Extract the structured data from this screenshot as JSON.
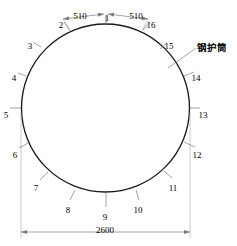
{
  "drawing": {
    "title": "钢护筒 截面分段图",
    "shape": "circle",
    "colors": {
      "outline": "#1b1b1b",
      "dimension": "#7a7a7a",
      "label_text": "#4a4a4a",
      "annotation_text": "#222222",
      "background": "#ffffff"
    },
    "geometry": {
      "center_x": 105.5,
      "center_y": 108,
      "radius": 84
    }
  },
  "annotation": {
    "text": "钢护筒",
    "leader_from_x": 196,
    "leader_from_y": 48,
    "leader_to_x": 168,
    "leader_to_y": 68
  },
  "dimensions": [
    {
      "id": "dim-chord-left",
      "value": "510",
      "text_x": 80,
      "text_y": 11,
      "line_x1": 63,
      "line_y1": 19,
      "line_x2": 104,
      "line_y2": 14
    },
    {
      "id": "dim-chord-right",
      "value": "510",
      "text_x": 136,
      "text_y": 11,
      "line_x1": 108,
      "line_y1": 14,
      "line_x2": 148,
      "line_y2": 19
    },
    {
      "id": "dim-diameter",
      "value": "2600",
      "text_x": 105,
      "text_y": 225,
      "line_x1": 21,
      "line_y1": 232,
      "line_x2": 190,
      "line_y2": 232
    }
  ],
  "segment_labels": [
    {
      "id": 1,
      "text": "1",
      "x": 106,
      "y": 13,
      "lx1": 106,
      "ly1": 16,
      "lx2": 106,
      "ly2": 24
    },
    {
      "id": 2,
      "text": "2",
      "x": 60,
      "y": 20,
      "lx1": 64,
      "ly1": 22,
      "lx2": 70,
      "ly2": 30
    },
    {
      "id": 3,
      "text": "3",
      "x": 29,
      "y": 41,
      "lx1": 33,
      "ly1": 42,
      "lx2": 41,
      "ly2": 47
    },
    {
      "id": 4,
      "text": "4",
      "x": 13,
      "y": 73,
      "lx1": 18,
      "ly1": 73,
      "lx2": 26,
      "ly2": 76
    },
    {
      "id": 5,
      "text": "5",
      "x": 5,
      "y": 110,
      "lx1": 10,
      "ly1": 108,
      "lx2": 21,
      "ly2": 108
    },
    {
      "id": 6,
      "text": "6",
      "x": 14,
      "y": 150,
      "lx1": 19,
      "ly1": 148,
      "lx2": 28,
      "ly2": 143
    },
    {
      "id": 7,
      "text": "7",
      "x": 35,
      "y": 183,
      "lx1": 40,
      "ly1": 180,
      "lx2": 48,
      "ly2": 172
    },
    {
      "id": 8,
      "text": "8",
      "x": 67,
      "y": 205,
      "lx1": 70,
      "ly1": 200,
      "lx2": 75,
      "ly2": 190
    },
    {
      "id": 9,
      "text": "9",
      "x": 104,
      "y": 212,
      "lx1": 106,
      "ly1": 207,
      "lx2": 106,
      "ly2": 192
    },
    {
      "id": 10,
      "text": "10",
      "x": 137,
      "y": 205,
      "lx1": 139,
      "ly1": 200,
      "lx2": 136,
      "ly2": 190
    },
    {
      "id": 11,
      "text": "11",
      "x": 172,
      "y": 183,
      "lx1": 172,
      "ly1": 178,
      "lx2": 164,
      "ly2": 171
    },
    {
      "id": 12,
      "text": "12",
      "x": 196,
      "y": 150,
      "lx1": 195,
      "ly1": 147,
      "lx2": 184,
      "ly2": 142
    },
    {
      "id": 13,
      "text": "13",
      "x": 202,
      "y": 110,
      "lx1": 200,
      "ly1": 108,
      "lx2": 190,
      "ly2": 108
    },
    {
      "id": 14,
      "text": "14",
      "x": 195,
      "y": 73,
      "lx1": 194,
      "ly1": 72,
      "lx2": 184,
      "ly2": 76
    },
    {
      "id": 15,
      "text": "15",
      "x": 168,
      "y": 41,
      "lx1": 167,
      "ly1": 43,
      "lx2": 160,
      "ly2": 49
    },
    {
      "id": 16,
      "text": "16",
      "x": 150,
      "y": 20,
      "lx1": 150,
      "ly1": 22,
      "lx2": 143,
      "ly2": 30
    }
  ]
}
